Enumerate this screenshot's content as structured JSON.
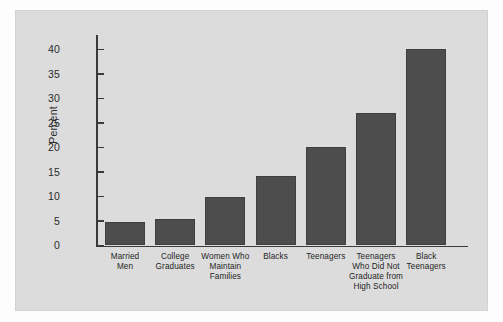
{
  "figure": {
    "background_color": "#fdfdfd",
    "panel_color": "#dcdcdc",
    "bar_color": "#4d4d4d",
    "axis_color": "#3a3a3a"
  },
  "chart_data": {
    "type": "bar",
    "title": "",
    "subtitle": "",
    "xlabel": "",
    "ylabel": "Percent",
    "ylim": [
      0,
      43
    ],
    "yticks": [
      0,
      5,
      10,
      15,
      20,
      25,
      30,
      35,
      40
    ],
    "ytick_labels": [
      "0",
      "5",
      "10",
      "15",
      "20",
      "25",
      "30",
      "35",
      "40"
    ],
    "grid": false,
    "legend": false,
    "categories": [
      "Married\nMen",
      "College\nGraduates",
      "Women Who\nMaintain\nFamilies",
      "Blacks",
      "Teenagers",
      "Teenagers\nWho Did Not\nGraduate from\nHigh School",
      "Black\nTeenagers"
    ],
    "values": [
      4.9,
      5.4,
      10.0,
      14.2,
      20.1,
      27.1,
      40.2
    ]
  }
}
